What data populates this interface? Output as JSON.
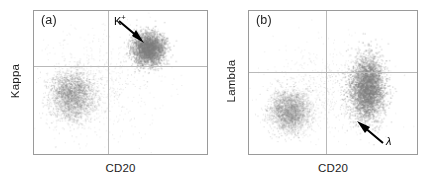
{
  "figure": {
    "dot_color": "#7c7c7c",
    "frame_color": "#9a9a9a",
    "quadrant_line_color": "#b9b9b9"
  },
  "panels": [
    {
      "tag": "(a)",
      "x_label": "CD20",
      "y_label": "Kappa",
      "annotation": {
        "base": "K",
        "superscript": "+",
        "arrow": "arrow-down-right"
      }
    },
    {
      "tag": "(b)",
      "x_label": "CD20",
      "y_label": "Lambda",
      "annotation": {
        "base": "λ",
        "superscript": "",
        "arrow": "arrow-up-left"
      }
    }
  ],
  "chart_data": [
    {
      "type": "scatter",
      "title": "(a)",
      "xlabel": "CD20",
      "ylabel": "Kappa",
      "xlim": [
        0,
        100
      ],
      "ylim": [
        0,
        100
      ],
      "grid": false,
      "quadrant_x": 42,
      "quadrant_y": 62,
      "legend": "none",
      "annotations": [
        {
          "text": "K+",
          "x": 48,
          "y": 95,
          "points_to_x": 66,
          "points_to_y": 80
        }
      ],
      "populations": [
        {
          "name": "CD20-negative / Kappa-intermediate",
          "center_x": 22,
          "center_y": 41,
          "spread_x": 13,
          "spread_y": 17,
          "n_points": 2600,
          "density": "diffuse"
        },
        {
          "name": "CD20-positive / Kappa-bright (K+ clonal)",
          "center_x": 66,
          "center_y": 74,
          "spread_x": 9,
          "spread_y": 11,
          "n_points": 3000,
          "density": "dense"
        },
        {
          "name": "background debris",
          "center_x": 35,
          "center_y": 48,
          "spread_x": 34,
          "spread_y": 34,
          "n_points": 700,
          "density": "sparse"
        }
      ]
    },
    {
      "type": "scatter",
      "title": "(b)",
      "xlabel": "CD20",
      "ylabel": "Lambda",
      "xlim": [
        0,
        100
      ],
      "ylim": [
        0,
        100
      ],
      "grid": false,
      "quadrant_x": 45,
      "quadrant_y": 58,
      "legend": "none",
      "annotations": [
        {
          "text": "λ",
          "x": 80,
          "y": 14,
          "points_to_x": 64,
          "points_to_y": 28
        }
      ],
      "populations": [
        {
          "name": "CD20-negative / Lambda-low",
          "center_x": 24,
          "center_y": 30,
          "spread_x": 12,
          "spread_y": 14,
          "n_points": 2400,
          "density": "diffuse"
        },
        {
          "name": "CD20-positive / Lambda-spanning",
          "center_x": 70,
          "center_y": 46,
          "spread_x": 10,
          "spread_y": 22,
          "n_points": 3600,
          "density": "dense"
        },
        {
          "name": "background debris",
          "center_x": 45,
          "center_y": 45,
          "spread_x": 35,
          "spread_y": 33,
          "n_points": 700,
          "density": "sparse"
        }
      ]
    }
  ]
}
